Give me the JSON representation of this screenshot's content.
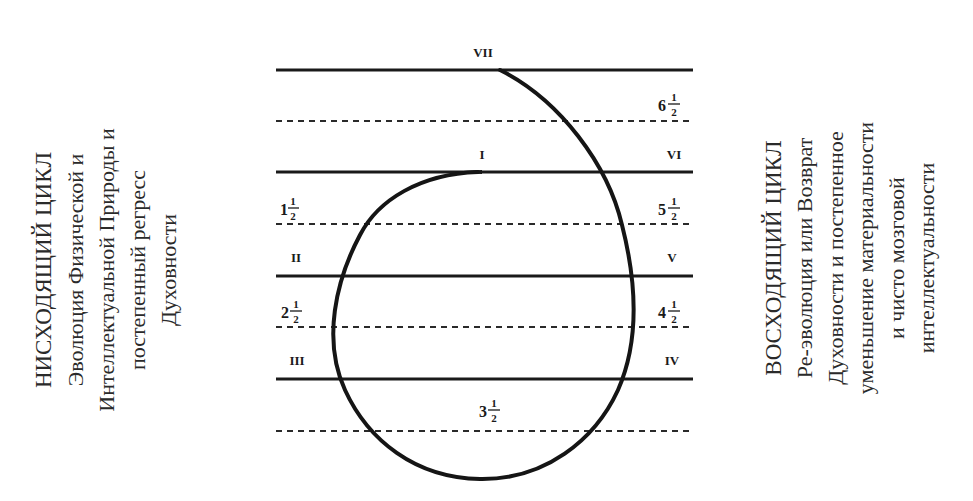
{
  "left_block": {
    "title": "НИСХОДЯЩИЙ ЦИКЛ",
    "lines": [
      "Эволюция Физической и",
      "Интеллектуальной Природы и",
      "постепенный регресс",
      "Духовности"
    ]
  },
  "right_block": {
    "title": "ВОСХОДЯЩИЙ ЦИКЛ",
    "lines": [
      "Ре-эволюция или Возврат",
      "Духовности и постепенное",
      "уменьшение материальности",
      "и чисто мозговой",
      "интеллектуальности"
    ]
  },
  "diagram": {
    "solid_levels": [
      {
        "y": 70,
        "left_label": "",
        "right_label": "",
        "top_label": "VII"
      },
      {
        "y": 172,
        "left_label": "",
        "right_label": "VI",
        "top_label": "I"
      },
      {
        "y": 276,
        "left_label": "II",
        "right_label": "V"
      },
      {
        "y": 379,
        "left_label": "III",
        "right_label": "IV"
      }
    ],
    "dashed_levels": [
      {
        "y": 121,
        "left_label": "",
        "right_label": "6½"
      },
      {
        "y": 224,
        "left_label": "1½",
        "right_label": "5½"
      },
      {
        "y": 327,
        "left_label": "2½",
        "right_label": "4½"
      },
      {
        "y": 431,
        "center_label": "3½"
      }
    ],
    "labels": {
      "vii": "VII",
      "i": "I",
      "vi": "VI",
      "ii": "II",
      "v": "V",
      "iii": "III",
      "iv": "IV",
      "half_6_whole": "6",
      "half_5_whole": "5",
      "half_4_whole": "4",
      "half_3_whole": "3",
      "half_2_whole": "2",
      "half_1_whole": "1",
      "num": "1",
      "den": "2"
    },
    "spiral_description": "Spiral curve starting at level I, descending left through II and III to the bottom (3½), then ascending right through IV, V, VI to VII"
  }
}
